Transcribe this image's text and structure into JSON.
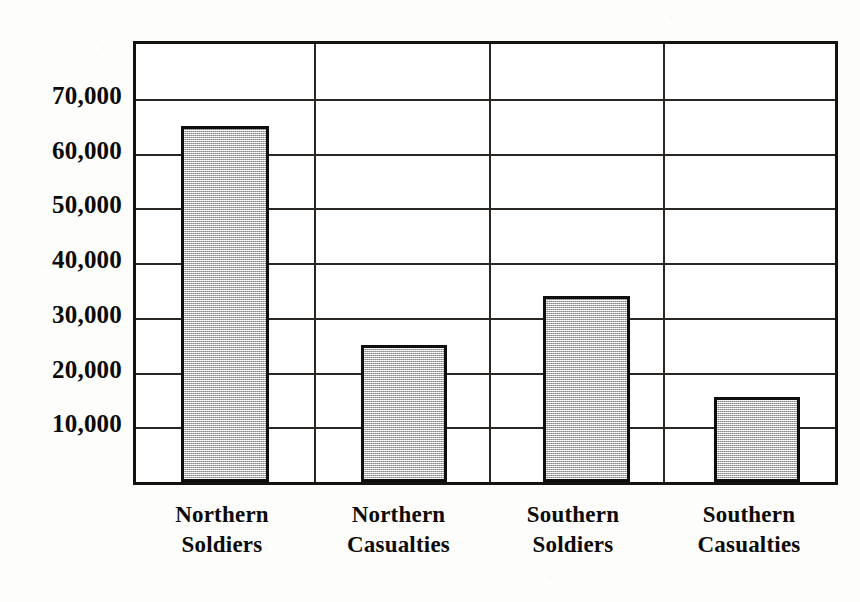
{
  "chart_data": {
    "type": "bar",
    "title": "",
    "subtitle": "",
    "xlabel": "",
    "ylabel": "",
    "categories": [
      "Northern Soldiers",
      "Northern Casualties",
      "Southern Soldiers",
      "Southern Casualties"
    ],
    "category_lines": [
      [
        "Northern",
        "Soldiers"
      ],
      [
        "Northern",
        "Casualties"
      ],
      [
        "Southern",
        "Soldiers"
      ],
      [
        "Southern",
        "Casualties"
      ]
    ],
    "values": [
      65000,
      25000,
      34000,
      15500
    ],
    "ylim": [
      0,
      80000
    ],
    "ytick_values": [
      70000,
      60000,
      50000,
      40000,
      30000,
      20000,
      10000
    ],
    "ytick_labels": [
      "70,000",
      "60,000",
      "50,000",
      "40,000",
      "30,000",
      "20,000",
      "10,000"
    ],
    "grid": {
      "horizontal": true,
      "vertical": true,
      "vertical_count": 3
    },
    "legend": null,
    "bar_fill_color": "#c2c2c2",
    "bar_border_color": "#100e0c",
    "axis_color": "#15120f",
    "background_color": "#ffffff"
  },
  "axis": {
    "y_labels": [
      {
        "text": "70,000",
        "value": 70000
      },
      {
        "text": "60,000",
        "value": 60000
      },
      {
        "text": "50,000",
        "value": 50000
      },
      {
        "text": "40,000",
        "value": 40000
      },
      {
        "text": "30,000",
        "value": 30000
      },
      {
        "text": "20,000",
        "value": 20000
      },
      {
        "text": "10,000",
        "value": 10000
      }
    ],
    "x_labels": [
      {
        "line1": "Northern",
        "line2": "Soldiers"
      },
      {
        "line1": "Northern",
        "line2": "Casualties"
      },
      {
        "line1": "Southern",
        "line2": "Soldiers"
      },
      {
        "line1": "Southern",
        "line2": "Casualties"
      }
    ]
  }
}
